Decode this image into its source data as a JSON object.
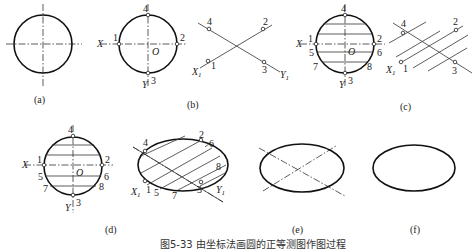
{
  "figure": {
    "caption": "图5-33  由坐标法画圆的正等测图作图过程",
    "panels": [
      {
        "id": "a",
        "label": "(a)",
        "content": "circle with centerlines"
      },
      {
        "id": "b",
        "label": "(b)",
        "content": "circle with axes X,Y, points 1-4, center O; isometric axes X1,Y1 with points 1-4"
      },
      {
        "id": "c",
        "label": "(c)",
        "content": "circle with horizontal chords, points 1-8; parallel lines on isometric axes"
      },
      {
        "id": "d",
        "label": "(d)",
        "content": "circle with chords and points 1-8; ellipse with parallel chords and points 1-8"
      },
      {
        "id": "e",
        "label": "(e)",
        "content": "ellipse with isometric axes"
      },
      {
        "id": "f",
        "label": "(f)",
        "content": "final ellipse"
      }
    ],
    "labels": {
      "X": "X",
      "Y": "Y",
      "O": "O",
      "X1": "X",
      "Y1": "Y",
      "sub1": "1",
      "p1": "1",
      "p2": "2",
      "p3": "3",
      "p4": "4",
      "p5": "5",
      "p6": "6",
      "p7": "7",
      "p8": "8"
    }
  }
}
